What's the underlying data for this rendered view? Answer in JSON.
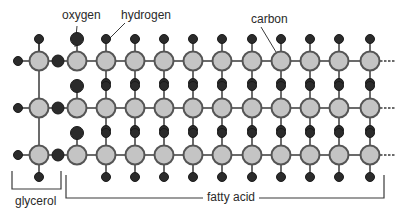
{
  "labels": {
    "oxygen": "oxygen",
    "hydrogen": "hydrogen",
    "carbon": "carbon",
    "glycerol": "glycerol",
    "fatty_acid": "fatty acid"
  },
  "colors": {
    "carbon_fill": "#c4c4c4",
    "carbon_stroke": "#555555",
    "atom_dark": "#2b2b2b",
    "bond": "#3a3a3a",
    "text": "#2a2a2a"
  },
  "structure": {
    "rows_y": [
      61,
      108,
      155
    ],
    "glycerol_carbon_x": 39,
    "glycerol_left_h_x": 18,
    "ester_oxygen_x": 58,
    "fatty_carbon_x": [
      77,
      106,
      135,
      164,
      193,
      222,
      252,
      281,
      310,
      339,
      370
    ],
    "carbon_radius": 9.5,
    "hydrogen_radius": 4.5,
    "oxygen_radius": 6,
    "chain_continues": true
  }
}
